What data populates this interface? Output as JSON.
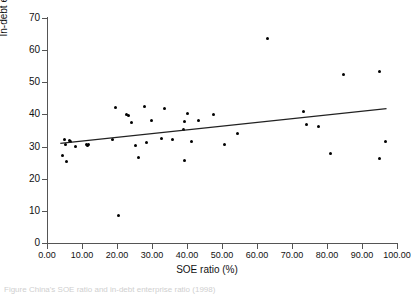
{
  "chart_data": {
    "type": "scatter",
    "title": "",
    "xlabel": "SOE ratio (%)",
    "ylabel": "In-debt enterprise ratio (%)",
    "xlim": [
      0,
      100
    ],
    "ylim": [
      0,
      70
    ],
    "xticks": [
      "0.00",
      "10.00",
      "20.00",
      "30.00",
      "40.00",
      "50.00",
      "60.00",
      "70.00",
      "80.00",
      "90.00",
      "100.00"
    ],
    "yticks": [
      "0",
      "10",
      "20",
      "30",
      "40",
      "50",
      "60",
      "70"
    ],
    "grid": false,
    "legend": null,
    "marker": "filled-diamond",
    "marker_color": "#000000",
    "points": [
      {
        "x": 4.3,
        "y": 27.2
      },
      {
        "x": 5.0,
        "y": 32.1
      },
      {
        "x": 5.4,
        "y": 30.5
      },
      {
        "x": 5.6,
        "y": 25.4
      },
      {
        "x": 6.3,
        "y": 32.0
      },
      {
        "x": 6.6,
        "y": 31.6
      },
      {
        "x": 8.0,
        "y": 30.0
      },
      {
        "x": 11.2,
        "y": 30.6
      },
      {
        "x": 11.6,
        "y": 30.2
      },
      {
        "x": 11.9,
        "y": 30.8
      },
      {
        "x": 18.6,
        "y": 32.1
      },
      {
        "x": 19.7,
        "y": 42.2
      },
      {
        "x": 20.5,
        "y": 8.7
      },
      {
        "x": 22.8,
        "y": 40.1
      },
      {
        "x": 23.2,
        "y": 39.8
      },
      {
        "x": 24.1,
        "y": 37.4
      },
      {
        "x": 25.3,
        "y": 30.2
      },
      {
        "x": 26.0,
        "y": 26.6
      },
      {
        "x": 27.8,
        "y": 42.4
      },
      {
        "x": 28.4,
        "y": 31.2
      },
      {
        "x": 29.8,
        "y": 38.0
      },
      {
        "x": 32.6,
        "y": 32.5
      },
      {
        "x": 33.6,
        "y": 41.9
      },
      {
        "x": 35.8,
        "y": 32.2
      },
      {
        "x": 39.0,
        "y": 35.4
      },
      {
        "x": 39.3,
        "y": 37.9
      },
      {
        "x": 39.4,
        "y": 25.6
      },
      {
        "x": 40.0,
        "y": 40.2
      },
      {
        "x": 41.2,
        "y": 31.7
      },
      {
        "x": 43.4,
        "y": 38.0
      },
      {
        "x": 47.7,
        "y": 40.1
      },
      {
        "x": 50.8,
        "y": 30.7
      },
      {
        "x": 54.3,
        "y": 34.0
      },
      {
        "x": 62.9,
        "y": 63.7
      },
      {
        "x": 73.2,
        "y": 40.8
      },
      {
        "x": 74.2,
        "y": 36.9
      },
      {
        "x": 77.6,
        "y": 36.4
      },
      {
        "x": 80.9,
        "y": 27.8
      },
      {
        "x": 84.6,
        "y": 52.3
      },
      {
        "x": 94.9,
        "y": 53.3
      },
      {
        "x": 95.0,
        "y": 26.2
      },
      {
        "x": 96.8,
        "y": 31.5
      }
    ],
    "trendline": {
      "type": "linear",
      "x_start": 3.8,
      "y_start": 31.0,
      "x_end": 97.0,
      "y_end": 41.8,
      "color": "#222222"
    }
  },
  "caption": {
    "text": "Figure   China's SOE ratio and in-debt enterprise ratio (1998)"
  }
}
